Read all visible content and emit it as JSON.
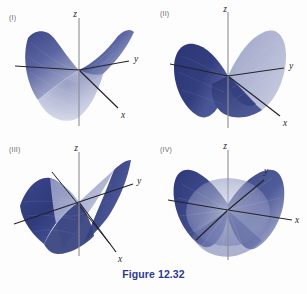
{
  "figure": {
    "caption": "Figure 12.32",
    "caption_color": "#2b3a8f",
    "background_color": "#fdfdfd",
    "width": 307,
    "height": 294
  },
  "palette": {
    "surface_dark": "#2d3a7a",
    "surface_mid": "#4a5494",
    "surface_light": "#b8bdd8",
    "surface_pale": "#d6d9e8",
    "axis": "#2a2a30",
    "axis_gray": "#8d8d95",
    "label_text": "#6a6a72"
  },
  "panels": [
    {
      "id": "I",
      "label": "(I)",
      "surface_type": "saddle",
      "description": "Hyperbolic paraboloid z = x^2 - y^2 viewed from above the xy-plane; upward-opening valley toward viewer, downward saddle arms left and right.",
      "axes": {
        "z": "z",
        "y": "y",
        "x": "x"
      }
    },
    {
      "id": "II",
      "label": "(II)",
      "surface_type": "saddle",
      "description": "Hyperbolic paraboloid viewed nearly edge-on along the saddle axis; two lobes rise left and right of the z-axis.",
      "axes": {
        "z": "z",
        "y": "y",
        "x": "x"
      }
    },
    {
      "id": "III",
      "label": "(III)",
      "surface_type": "saddle-twisted",
      "description": "Hyperbolic paraboloid rotated so the ruling lines are visible; surface twists with one arm up-right and one down-left.",
      "axes": {
        "z": "z",
        "y": "y",
        "x": "x"
      }
    },
    {
      "id": "IV",
      "label": "(IV)",
      "surface_type": "saddle",
      "description": "Hyperbolic paraboloid viewed with the x-axis toward the right; radial shading stripes, lobes up at left-rear and right-front.",
      "axes": {
        "z": "z",
        "y": "y",
        "x": "x"
      }
    }
  ]
}
